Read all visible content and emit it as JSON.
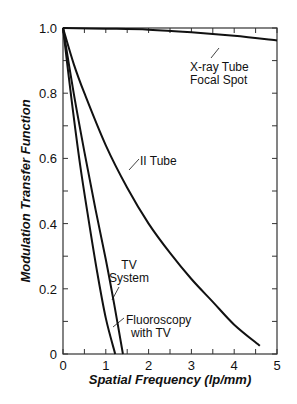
{
  "chart_data": {
    "type": "line",
    "title": "",
    "xlabel": "Spatial Frequency (lp/mm)",
    "ylabel": "Modulation Transfer Function",
    "xlim": [
      0,
      5
    ],
    "ylim": [
      0,
      1.0
    ],
    "grid": false,
    "legend": "none (curves labeled by inline annotations)",
    "x_ticks": [
      "0",
      "1",
      "2",
      "3",
      "4",
      "5"
    ],
    "y_ticks": [
      "0",
      "0.2",
      "0.4",
      "0.6",
      "0.8",
      "1.0"
    ],
    "series": [
      {
        "name": "X-ray Tube Focal Spot",
        "x": [
          0,
          1,
          2,
          3,
          4,
          5
        ],
        "y": [
          1.0,
          0.998,
          0.995,
          0.987,
          0.976,
          0.962
        ]
      },
      {
        "name": "II Tube",
        "x": [
          0,
          0.25,
          0.5,
          1.0,
          1.5,
          2.0,
          2.5,
          3.0,
          3.5,
          4.0,
          4.6
        ],
        "y": [
          1.0,
          0.89,
          0.8,
          0.64,
          0.51,
          0.4,
          0.31,
          0.23,
          0.16,
          0.09,
          0.025
        ]
      },
      {
        "name": "TV System",
        "x": [
          0,
          0.25,
          0.5,
          0.75,
          1.0,
          1.2,
          1.4
        ],
        "y": [
          1.0,
          0.8,
          0.62,
          0.45,
          0.29,
          0.15,
          0.0
        ]
      },
      {
        "name": "Fluoroscopy with TV",
        "x": [
          0,
          0.2,
          0.4,
          0.6,
          0.8,
          1.0,
          1.22
        ],
        "y": [
          1.0,
          0.78,
          0.58,
          0.41,
          0.25,
          0.11,
          0.0
        ]
      }
    ],
    "annotations": [
      {
        "text": [
          "X-ray Tube",
          "Focal Spot"
        ],
        "points_to": "X-ray Tube Focal Spot",
        "at": [
          3.5,
          0.93
        ]
      },
      {
        "text": [
          "II Tube"
        ],
        "points_to": "II Tube",
        "at": [
          1.9,
          0.45
        ]
      },
      {
        "text": [
          "TV",
          "System"
        ],
        "points_to": "TV System",
        "at": [
          1.9,
          0.24
        ]
      },
      {
        "text": [
          "Fluoroscopy",
          "with TV"
        ],
        "points_to": "Fluoroscopy with TV",
        "at": [
          2.0,
          0.08
        ]
      }
    ]
  },
  "labels": {
    "xlabel": "Spatial Frequency (lp/mm)",
    "ylabel": "Modulation Transfer Function",
    "xray_line1": "X-ray Tube",
    "xray_line2": "Focal Spot",
    "ii_tube": "II Tube",
    "tv_line1": "TV",
    "tv_line2": "System",
    "fluoro_line1": "Fluoroscopy",
    "fluoro_line2": "with TV"
  },
  "colors": {
    "line": "#111111",
    "axis": "#333333",
    "background": "#ffffff"
  }
}
